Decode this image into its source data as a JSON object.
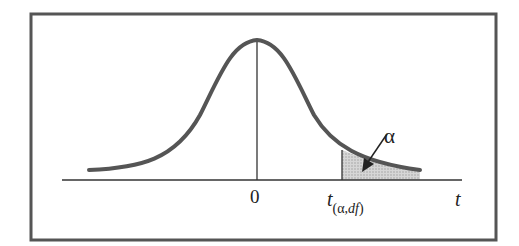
{
  "figure": {
    "type": "t-distribution right-tail critical region",
    "labels": {
      "center": "0",
      "x_axis": "t",
      "critical_value_main": "t",
      "critical_value_sub_open": "(α,",
      "critical_value_sub_df": "df",
      "critical_value_sub_close": ")",
      "tail_area": "α"
    },
    "colors": {
      "curve": "#555555",
      "axis": "#333333",
      "frame": "#555555",
      "shaded_tail": "#c8c8c8"
    }
  }
}
